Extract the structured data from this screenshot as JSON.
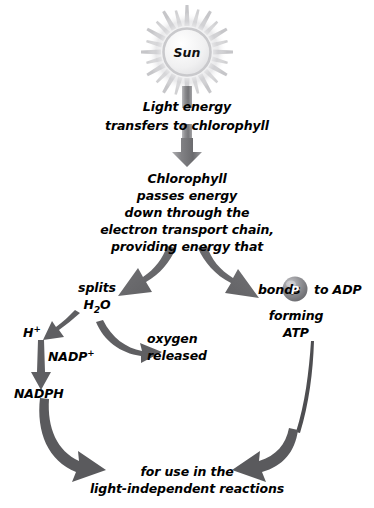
{
  "diagram": {
    "colors": {
      "arrow_dark": "#58585a",
      "arrow_mid": "#6e6e70",
      "arrow_light": "#a9a9ac",
      "sun_ray": "#b9b9bc",
      "sun_disc": "#f2f2f3",
      "sun_ring": "#c8c8cb",
      "phosphate": "#8d8d90",
      "text": "#000000",
      "background": "#ffffff"
    },
    "nodes": {
      "sun": {
        "label": "Sun",
        "name": "sun-node"
      },
      "light_energy": {
        "line1": "Light energy",
        "line2": "transfers to chlorophyll"
      },
      "chlorophyll": {
        "line1": "Chlorophyll",
        "line2": "passes energy",
        "line3": "down through the",
        "line4": "electron transport chain,",
        "line5": "providing energy that"
      },
      "splits_water": {
        "line1": "splits",
        "line2_pre": "H",
        "line2_sub": "2",
        "line2_post": "O"
      },
      "bonds_adp": {
        "pre": "bonds",
        "phosphate": "P",
        "post": "to ADP",
        "forming_line1": "forming",
        "forming_line2": "ATP"
      },
      "proton": {
        "base": "H",
        "sup": "+"
      },
      "nadp_plus": {
        "base": "NADP",
        "sup": "+"
      },
      "nadph": {
        "label": "NADPH"
      },
      "oxygen": {
        "line1": "oxygen",
        "line2": "released"
      },
      "outcome": {
        "line1": "for use in the",
        "line2": "light-independent reactions"
      }
    }
  }
}
